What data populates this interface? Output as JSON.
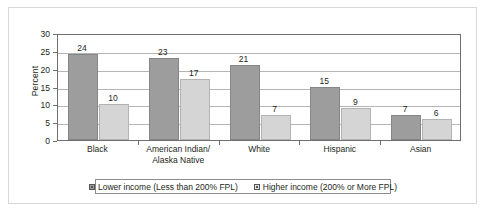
{
  "chart_data": {
    "type": "bar",
    "title": "",
    "xlabel": "",
    "ylabel": "Percent",
    "ylim": [
      0,
      30
    ],
    "yticks": [
      0,
      5,
      10,
      15,
      20,
      25,
      30
    ],
    "grid": true,
    "legend_position": "bottom",
    "categories": [
      "Black",
      "American Indian/\nAlaska Native",
      "White",
      "Hispanic",
      "Asian"
    ],
    "series": [
      {
        "name": "Lower income (Less than 200% FPL)",
        "color": "#9d9d9d",
        "values": [
          24,
          23,
          21,
          15,
          7
        ]
      },
      {
        "name": "Higher income (200% or More FPL)",
        "color": "#d5d5d5",
        "values": [
          10,
          17,
          7,
          9,
          6
        ]
      }
    ]
  },
  "axis": {
    "y_title": "Percent",
    "tick_0": "0",
    "tick_5": "5",
    "tick_10": "10",
    "tick_15": "15",
    "tick_20": "20",
    "tick_25": "25",
    "tick_30": "30"
  },
  "legend": {
    "items": [
      {
        "label": "Lower income (Less than 200% FPL)",
        "swatch": "lower"
      },
      {
        "label": "Higher income (200% or More FPL)",
        "swatch": "higher"
      }
    ]
  },
  "colors": {
    "lower_income_bar": "#9d9d9d",
    "higher_income_bar": "#d5d5d5",
    "axis_line": "#6f6f6f",
    "gridline": "#b5b5b5",
    "outer_frame": "#d8d8d8",
    "text": "#231f20"
  }
}
